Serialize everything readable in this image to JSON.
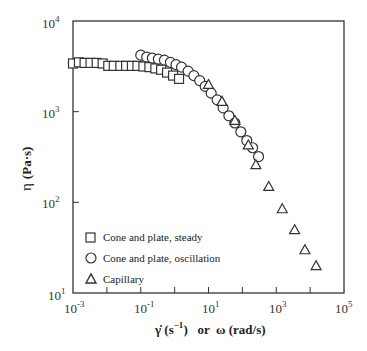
{
  "chart_data": {
    "type": "scatter",
    "title": "",
    "xlabel": "γ̇ (s⁻¹) or ω (rad/s)",
    "ylabel": "η (Pa·s)",
    "xscale": "log",
    "yscale": "log",
    "xlim": [
      0.001,
      100000
    ],
    "ylim": [
      10,
      10000
    ],
    "x_ticks": [
      "10^-3",
      "10^-1",
      "10^1",
      "10^3",
      "10^5"
    ],
    "y_ticks": [
      "10^1",
      "10^2",
      "10^3",
      "10^4"
    ],
    "grid": false,
    "legend_position": "lower-left inside",
    "series": [
      {
        "name": "Cone and plate, steady",
        "marker": "square",
        "x": [
          0.001,
          0.0015,
          0.0022,
          0.0033,
          0.005,
          0.0075,
          0.011,
          0.016,
          0.025,
          0.037,
          0.055,
          0.08,
          0.12,
          0.18,
          0.27,
          0.4,
          0.6,
          0.9,
          1.35
        ],
        "y": [
          3400,
          3500,
          3450,
          3450,
          3450,
          3400,
          3200,
          3200,
          3200,
          3200,
          3200,
          3200,
          3150,
          3100,
          3000,
          2900,
          2700,
          2500,
          2300
        ]
      },
      {
        "name": "Cone and plate, oscillation",
        "marker": "circle",
        "x": [
          0.1,
          0.15,
          0.22,
          0.33,
          0.5,
          0.75,
          1.1,
          1.6,
          2.5,
          3.7,
          5.5,
          8,
          12,
          18,
          27,
          40,
          60,
          90,
          135,
          200,
          300
        ],
        "y": [
          4200,
          4000,
          3900,
          3800,
          3700,
          3500,
          3300,
          3100,
          2800,
          2500,
          2200,
          1900,
          1600,
          1350,
          1100,
          900,
          750,
          600,
          480,
          400,
          320
        ]
      },
      {
        "name": "Capillary",
        "marker": "triangle",
        "x": [
          10,
          25,
          60,
          150,
          250,
          600,
          1500,
          3500,
          7000,
          15000
        ],
        "y": [
          2000,
          1300,
          800,
          430,
          260,
          150,
          85,
          50,
          30,
          20
        ]
      }
    ]
  },
  "legend": {
    "items": [
      {
        "label": "Cone and plate, steady",
        "symbol": "square"
      },
      {
        "label": "Cone and plate, oscillation",
        "symbol": "circle"
      },
      {
        "label": "Capillary",
        "symbol": "triangle"
      }
    ]
  },
  "axes": {
    "y_label_symbol": "η",
    "y_label_units": "(Pa·s)",
    "x_label_part1": "γ̇ (s",
    "x_label_exp": "−1",
    "x_label_part2": ")   or  ω (rad/s)",
    "x_tick_bases": [
      "10",
      "10",
      "10",
      "10",
      "10"
    ],
    "x_tick_exps": [
      "-3",
      "-1",
      "1",
      "3",
      "5"
    ],
    "y_tick_bases": [
      "10",
      "10",
      "10",
      "10"
    ],
    "y_tick_exps": [
      "4",
      "3",
      "2",
      "1"
    ]
  }
}
